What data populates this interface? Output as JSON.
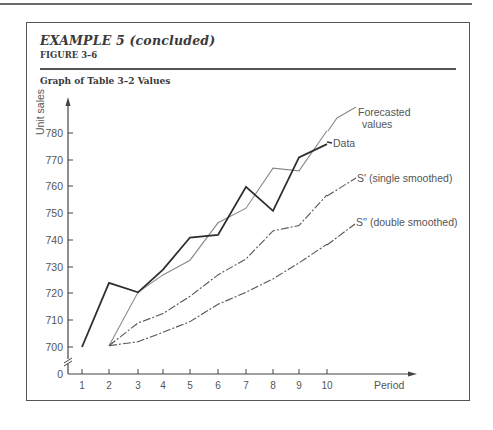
{
  "header": {
    "title": "EXAMPLE 5 (concluded)",
    "figure": "FIGURE 3–6",
    "subtitle": "Graph of Table 3–2 Values"
  },
  "chart_data": {
    "type": "line",
    "title": "Graph of Table 3–2 Values",
    "xlabel": "Period",
    "ylabel": "Unit sales",
    "x": [
      1,
      2,
      3,
      4,
      5,
      6,
      7,
      8,
      9,
      10
    ],
    "y_ticks": [
      0,
      700,
      710,
      720,
      730,
      740,
      750,
      760,
      770,
      780
    ],
    "x_ticks": [
      1,
      2,
      3,
      4,
      5,
      6,
      7,
      8,
      9,
      10
    ],
    "ylim": [
      700,
      785
    ],
    "axis_break": true,
    "grid": false,
    "legend": "inline labels at line ends",
    "series": [
      {
        "name": "Data",
        "values": [
          700,
          724,
          720.5,
          729,
          741,
          742,
          760,
          751,
          771,
          776
        ],
        "style": "solid-dark"
      },
      {
        "name": "Forecasted values",
        "values": [
          null,
          700.5,
          720.5,
          727,
          732.5,
          746.5,
          752,
          767,
          766,
          781
        ],
        "style": "solid-light"
      },
      {
        "name": "S' (single smoothed)",
        "values": [
          null,
          700.5,
          709,
          712.5,
          719,
          727,
          733,
          743.5,
          745.5,
          757
        ],
        "style": "dash-dot"
      },
      {
        "name": "S'' (double smoothed)",
        "values": [
          null,
          700.5,
          702,
          705.5,
          709.5,
          716,
          720.5,
          725.5,
          731.5,
          738.5
        ],
        "style": "dash-dot"
      }
    ]
  },
  "labels": {
    "data": "Data",
    "forecast_line1": "Forecasted",
    "forecast_line2": "values",
    "single": "S' (single smoothed)",
    "double": "S'' (double smoothed)",
    "y_axis": "Unit sales",
    "x_axis": "Period"
  },
  "ticks": {
    "y": [
      "780",
      "770",
      "760",
      "750",
      "740",
      "730",
      "720",
      "710",
      "700",
      "0"
    ],
    "x": [
      "1",
      "2",
      "3",
      "4",
      "5",
      "6",
      "7",
      "8",
      "9",
      "10"
    ]
  }
}
